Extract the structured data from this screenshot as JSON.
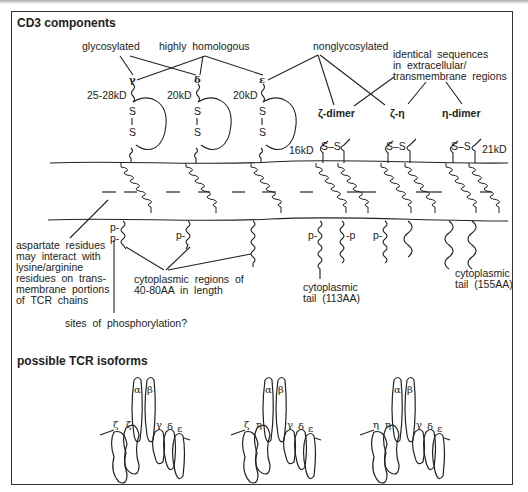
{
  "sections": {
    "cd3_title": "CD3 components",
    "isoforms_title": "possible TCR isoforms"
  },
  "groups": {
    "glycosylated": "glycosylated",
    "highly_homologous": "highly  homologous",
    "nonglycosylated": "nonglycosylated",
    "identical_line1": "identical  sequences",
    "identical_line2": "in  extracellular/",
    "identical_line3": "transmembrane  regions"
  },
  "chains": {
    "gamma": {
      "symbol": "γ",
      "weight": "25-28kD"
    },
    "delta": {
      "symbol": "δ",
      "weight": "20kD"
    },
    "epsilon": {
      "symbol": "ε",
      "weight": "20kD"
    },
    "zeta_dimer": {
      "label": "ζ-dimer",
      "weight": "16kD"
    },
    "zeta_eta": {
      "label": "ζ-η"
    },
    "eta_dimer": {
      "label": "η-dimer",
      "weight": "21kD"
    }
  },
  "disulfide": {
    "s": "S",
    "ss": "S–S"
  },
  "phospho": {
    "p_left": "p-",
    "p_right": "-p"
  },
  "annotations": {
    "aspartate_1": "aspartate  residues",
    "aspartate_2": "may  interact  with",
    "aspartate_3": "lysine/arginine",
    "aspartate_4": "residues  on  trans-",
    "aspartate_5": "membrane  portions",
    "aspartate_6": "of  TCR  chains",
    "cyto_regions_1": "cytoplasmic  regions  of",
    "cyto_regions_2": "40-80AA  in  length",
    "phospho_sites": "sites  of  phosphorylation?",
    "tail113_1": "cytoplasmic",
    "tail113_2": "tail  (113AA)",
    "tail155_1": "cytoplasmic",
    "tail155_2": "tail  (155AA)"
  },
  "isoforms": [
    {
      "labels": [
        "ζ",
        "ζ",
        "α",
        "β",
        "γ",
        "δ",
        "ε"
      ]
    },
    {
      "labels": [
        "ζ",
        "η",
        "α",
        "β",
        "γ",
        "δ",
        "ε"
      ]
    },
    {
      "labels": [
        "η",
        "η",
        "α",
        "β",
        "γ",
        "δ",
        "ε"
      ]
    }
  ]
}
